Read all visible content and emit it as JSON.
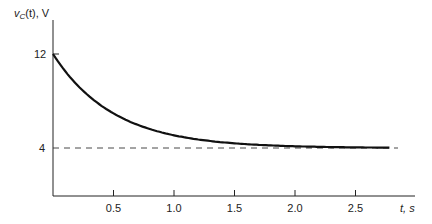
{
  "chart_data": {
    "type": "line",
    "title": "",
    "xlabel": "t, s",
    "ylabel": "v_C(t), V",
    "xlim": [
      0,
      2.8
    ],
    "ylim": [
      0,
      13.5
    ],
    "x_ticks": [
      "0.5",
      "1.0",
      "1.5",
      "2.0",
      "2.5"
    ],
    "y_ticks": [
      "12",
      "4"
    ],
    "grid": false,
    "series": [
      {
        "name": "v_C(t) = 4 + 8e^(-t/0.5)",
        "x": [
          0,
          0.25,
          0.5,
          0.75,
          1.0,
          1.25,
          1.5,
          1.75,
          2.0,
          2.25,
          2.5,
          2.8
        ],
        "values": [
          12,
          8.85,
          6.94,
          5.79,
          5.08,
          4.66,
          4.4,
          4.24,
          4.15,
          4.09,
          4.05,
          4.03
        ]
      },
      {
        "name": "asymptote",
        "style": "dashed",
        "x": [
          0,
          2.8
        ],
        "values": [
          4,
          4
        ]
      }
    ]
  },
  "labels": {
    "ylabel_main": "v",
    "ylabel_sub": "C",
    "ylabel_rest": "(t), V",
    "xlabel": "t, s",
    "y12": "12",
    "y4": "4",
    "xt": [
      "0.5",
      "1.0",
      "1.5",
      "2.0",
      "2.5"
    ]
  }
}
